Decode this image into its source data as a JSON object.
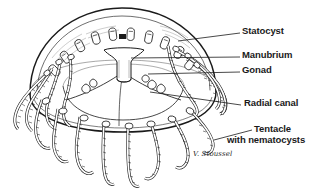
{
  "figure": {
    "kind": "scientific-line-drawing",
    "background_color": "#ffffff",
    "ink_color": "#1a1a1a",
    "width": 321,
    "height": 192
  },
  "labels": [
    {
      "id": "statocyst",
      "text": "Statocyst",
      "x": 242,
      "y": 29,
      "leader": {
        "x1": 240,
        "y1": 34,
        "x2": 178,
        "y2": 41
      }
    },
    {
      "id": "manubrium",
      "text": "Manubrium",
      "x": 242,
      "y": 53,
      "leader": {
        "x1": 240,
        "y1": 58,
        "x2": 129,
        "y2": 58
      }
    },
    {
      "id": "gonad",
      "text": "Gonad",
      "x": 242,
      "y": 68,
      "leader": {
        "x1": 240,
        "y1": 73,
        "x2": 145,
        "y2": 73
      }
    },
    {
      "id": "radial-canal",
      "text": "Radial canal",
      "x": 244,
      "y": 101,
      "leader": {
        "x1": 241,
        "y1": 106,
        "x2": 148,
        "y2": 93
      }
    },
    {
      "id": "tentacle-with-nematocysts",
      "text": "Tentacle\nwith nematocysts",
      "line1": "Tentacle",
      "line2": "with nematocysts",
      "x": 226,
      "y": 127,
      "leader": {
        "x1": 250,
        "y1": 131,
        "x2": 213,
        "y2": 140
      }
    }
  ],
  "signature": {
    "text": "V. Stoussel",
    "x": 193,
    "y": 153
  },
  "anatomy": {
    "bell_label": "bell / umbrella",
    "margin_label": "bell margin",
    "tentacle_count_visible": 16,
    "statocyst_count_visible": 10,
    "radial_canal_count_visible": 4
  }
}
